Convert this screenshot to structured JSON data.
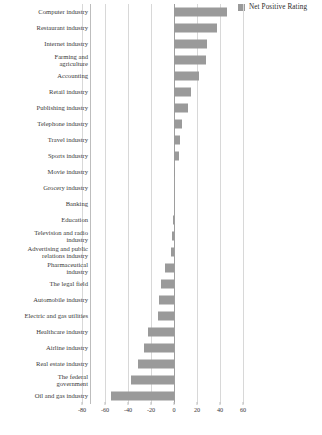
{
  "legend": {
    "label": "Net Positive Rating",
    "swatch_color": "#9a9a9a",
    "position": "top-right"
  },
  "axis": {
    "zero_value": 0,
    "ticks": [
      -80,
      -60,
      -40,
      -20,
      0,
      20,
      40,
      60
    ],
    "tick_labels": [
      "-80",
      "-60",
      "-40",
      "-20",
      "0",
      "20",
      "40",
      "60"
    ],
    "xlim": [
      -80,
      65
    ],
    "grid": true
  },
  "chart_data": {
    "type": "bar",
    "orientation": "horizontal",
    "title": "",
    "subtitle": "",
    "xlabel": "",
    "ylabel": "",
    "xlim": [
      -80,
      65
    ],
    "grid": true,
    "legend": [
      "Net Positive Rating"
    ],
    "legend_position": "top-right",
    "bar_color": "#9a9a9a",
    "categories": [
      "Computer industry",
      "Restaurant industry",
      "Internet industry",
      "Farming and\nagriculture",
      "Accounting",
      "Retail industry",
      "Publishing industry",
      "Telephone industry",
      "Travel industry",
      "Sports industry",
      "Movie industry",
      "Grocery industry",
      "Banking",
      "Education",
      "Television and radio\nindustry",
      "Advertising and public\nrelations industry",
      "Pharmaceutical\nindustry",
      "The legal field",
      "Automobile industry",
      "Electric and gas utilities",
      "Healthcare industry",
      "Airline industry",
      "Real estate industry",
      "The federal\ngovernment",
      "Oil and gas industry"
    ],
    "series": [
      {
        "name": "Net Positive Rating",
        "values": [
          46,
          37,
          29,
          28,
          22,
          15,
          12,
          7,
          5,
          4,
          1,
          0,
          0,
          -1,
          -2,
          -3,
          -8,
          -11,
          -13,
          -14,
          -23,
          -26,
          -31,
          -37,
          -55
        ]
      }
    ]
  }
}
